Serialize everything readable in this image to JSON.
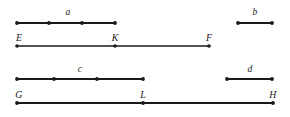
{
  "figure": {
    "type": "line-segment-diagram",
    "background_color": "#ffffff",
    "stroke_color": "#1a1a1a",
    "label_color": "#1a1a1a",
    "width": 290,
    "height": 117,
    "rows": [
      {
        "name": "row-a-b",
        "baseline_y": 23,
        "segments": [
          {
            "id": "segment-a",
            "label": "a",
            "label_x": 68,
            "label_y": 7,
            "x1": 17,
            "x2": 115,
            "endpoint_dots": [
              17,
              115
            ],
            "interior_dots": [
              49,
              82
            ],
            "parts": 3
          },
          {
            "id": "segment-b",
            "label": "b",
            "label_x": 255,
            "label_y": 7,
            "x1": 238,
            "x2": 272,
            "endpoint_dots": [
              238,
              272
            ],
            "interior_dots": [],
            "parts": 1
          }
        ]
      },
      {
        "name": "row-efk",
        "baseline_y": 46,
        "segments": [
          {
            "id": "segment-EF",
            "label": "",
            "x1": 17,
            "x2": 209,
            "endpoint_dots": [
              17,
              209
            ],
            "interior_dots": [
              115
            ],
            "parts": 2
          }
        ],
        "point_labels": [
          {
            "id": "point-label-E",
            "text": "E",
            "x": 19,
            "y": 33
          },
          {
            "id": "point-label-K",
            "text": "K",
            "x": 115,
            "y": 33
          },
          {
            "id": "point-label-F",
            "text": "F",
            "x": 209,
            "y": 33
          }
        ]
      },
      {
        "name": "row-c-d",
        "baseline_y": 79,
        "segments": [
          {
            "id": "segment-c",
            "label": "c",
            "label_x": 80,
            "label_y": 64,
            "x1": 17,
            "x2": 143,
            "endpoint_dots": [
              17,
              143
            ],
            "interior_dots": [
              54,
              97
            ],
            "parts": 3
          },
          {
            "id": "segment-d",
            "label": "d",
            "label_x": 250,
            "label_y": 64,
            "x1": 227,
            "x2": 272,
            "endpoint_dots": [
              227,
              272
            ],
            "interior_dots": [],
            "parts": 1
          }
        ]
      },
      {
        "name": "row-glh",
        "baseline_y": 103,
        "segments": [
          {
            "id": "segment-GH",
            "label": "",
            "x1": 17,
            "x2": 273,
            "endpoint_dots": [
              17,
              273
            ],
            "interior_dots": [
              143
            ],
            "parts": 2
          }
        ],
        "point_labels": [
          {
            "id": "point-label-G",
            "text": "G",
            "x": 19,
            "y": 90
          },
          {
            "id": "point-label-L",
            "text": "L",
            "x": 143,
            "y": 90
          },
          {
            "id": "point-label-H",
            "text": "H",
            "x": 273,
            "y": 90
          }
        ]
      }
    ],
    "segment_labels": {
      "a": "a",
      "b": "b",
      "c": "c",
      "d": "d"
    },
    "point_labels": {
      "E": "E",
      "K": "K",
      "F": "F",
      "G": "G",
      "L": "L",
      "H": "H"
    }
  }
}
